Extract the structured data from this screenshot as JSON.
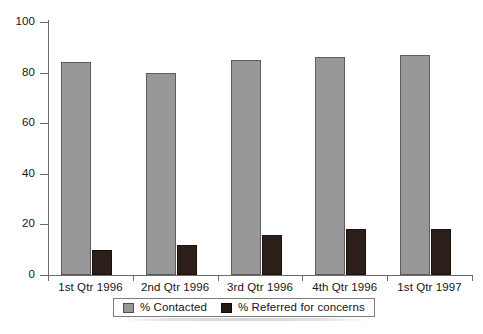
{
  "chart_data": {
    "type": "bar",
    "title": "",
    "subtitle": "",
    "xlabel": "",
    "ylabel": "",
    "ylim": [
      0,
      100
    ],
    "yticks": [
      0,
      20,
      40,
      60,
      80,
      100
    ],
    "grid": false,
    "legend_position": "bottom",
    "categories": [
      "1st Qtr 1996",
      "2nd Qtr 1996",
      "3rd Qtr 1996",
      "4th Qtr 1996",
      "1st Qtr 1997"
    ],
    "series": [
      {
        "name": "% Contacted",
        "color": "#989898",
        "values": [
          84,
          80,
          85,
          86,
          87
        ]
      },
      {
        "name": "% Referred for concerns",
        "color": "#2c1f19",
        "values": [
          10,
          12,
          16,
          18,
          18
        ]
      }
    ]
  },
  "axis": {
    "y_tick_labels": [
      "0",
      "20",
      "40",
      "60",
      "80",
      "100"
    ]
  },
  "legend": {
    "items": [
      {
        "label": "% Contacted",
        "swatch": "light-gray-swatch"
      },
      {
        "label": "% Referred for concerns",
        "swatch": "dark-swatch"
      }
    ]
  }
}
